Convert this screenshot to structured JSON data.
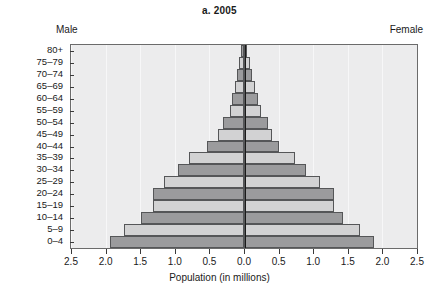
{
  "chart_data": {
    "type": "bar",
    "subtype": "population-pyramid",
    "title": "a. 2005",
    "xlabel": "Population (in millions)",
    "ylabel": "",
    "left_side_label": "Male",
    "right_side_label": "Female",
    "categories": [
      "80+",
      "75–79",
      "70–74",
      "65–69",
      "60–64",
      "55–59",
      "50–54",
      "45–49",
      "40–44",
      "35–39",
      "30–34",
      "25–29",
      "20–24",
      "15–19",
      "10–14",
      "5–9",
      "0–4"
    ],
    "series": [
      {
        "name": "Male",
        "values": [
          0.04,
          0.07,
          0.1,
          0.13,
          0.17,
          0.2,
          0.31,
          0.38,
          0.54,
          0.79,
          0.96,
          1.15,
          1.31,
          1.31,
          1.49,
          1.73,
          1.94
        ]
      },
      {
        "name": "Female",
        "values": [
          0.05,
          0.08,
          0.12,
          0.16,
          0.2,
          0.25,
          0.35,
          0.4,
          0.51,
          0.74,
          0.9,
          1.1,
          1.3,
          1.3,
          1.43,
          1.67,
          1.88
        ]
      }
    ],
    "xtick_labels": [
      "2.5",
      "2.0",
      "1.5",
      "1.0",
      "0.5",
      "0.0",
      "0.5",
      "1.0",
      "1.5",
      "2.0",
      "2.5"
    ],
    "xtick_values": [
      -2.5,
      -2.0,
      -1.5,
      -1.0,
      -0.5,
      0.0,
      0.5,
      1.0,
      1.5,
      2.0,
      2.5
    ],
    "xlim": [
      -2.5,
      2.5
    ],
    "grid": true,
    "legend": "none",
    "bar_colors": {
      "dark": "#9b9b9d",
      "light": "#d2d2d3",
      "border": "#555658"
    },
    "plot_background": "#ececed",
    "bar_shade_pattern": [
      "dark",
      "light",
      "dark",
      "light",
      "dark",
      "light",
      "dark",
      "light",
      "dark",
      "light",
      "dark",
      "light",
      "dark",
      "light",
      "dark",
      "light",
      "dark"
    ]
  }
}
